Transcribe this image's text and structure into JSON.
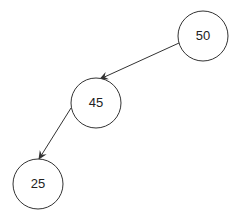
{
  "diagram": {
    "type": "binary-tree",
    "nodes": [
      {
        "id": "n50",
        "label": "50",
        "cx": 203,
        "cy": 36,
        "r": 25
      },
      {
        "id": "n45",
        "label": "45",
        "cx": 96,
        "cy": 103,
        "r": 25
      },
      {
        "id": "n25",
        "label": "25",
        "cx": 38,
        "cy": 184,
        "r": 25
      }
    ],
    "edges": [
      {
        "from": "50",
        "to": "45",
        "direction": "left-child"
      },
      {
        "from": "45",
        "to": "25",
        "direction": "left-child"
      }
    ],
    "colors": {
      "stroke": "#333333",
      "fill": "#ffffff",
      "text": "#222222"
    }
  }
}
